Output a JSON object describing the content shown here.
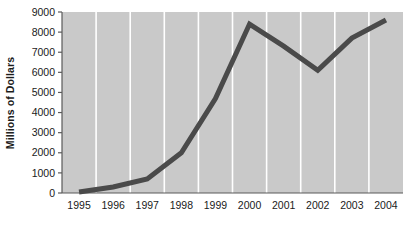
{
  "chart_data": {
    "type": "line",
    "title": "",
    "xlabel": "",
    "ylabel": "Millions of Dollars",
    "categories": [
      "1995",
      "1996",
      "1997",
      "1998",
      "1999",
      "2000",
      "2001",
      "2002",
      "2003",
      "2004"
    ],
    "values": [
      50,
      300,
      700,
      2000,
      4700,
      8400,
      7300,
      6100,
      7700,
      8600
    ],
    "series": [
      {
        "name": "",
        "values": [
          50,
          300,
          700,
          2000,
          4700,
          8400,
          7300,
          6100,
          7700,
          8600
        ]
      }
    ],
    "ylim": [
      0,
      9000
    ],
    "ytick_labels": [
      "0",
      "1000",
      "2000",
      "3000",
      "4000",
      "5000",
      "6000",
      "7000",
      "8000",
      "9000"
    ],
    "ytick_values": [
      0,
      1000,
      2000,
      3000,
      4000,
      5000,
      6000,
      7000,
      8000,
      9000
    ],
    "xtick_labels": [
      "1995",
      "1996",
      "1997",
      "1998",
      "1999",
      "2000",
      "2001",
      "2002",
      "2003",
      "2004"
    ],
    "grid": "vertical-white",
    "legend": "none",
    "plot_background": "#c9c9c9",
    "line_color": "#4a4a4a",
    "gridline_color": "#ffffff",
    "axis_color": "#555555",
    "line_width": 5
  },
  "axis": {
    "y_label": "Millions of Dollars",
    "y_ticks": [
      "9000",
      "8000",
      "7000",
      "6000",
      "5000",
      "4000",
      "3000",
      "2000",
      "1000",
      "0"
    ],
    "x_ticks": [
      "1995",
      "1996",
      "1997",
      "1998",
      "1999",
      "2000",
      "2001",
      "2002",
      "2003",
      "2004"
    ]
  }
}
